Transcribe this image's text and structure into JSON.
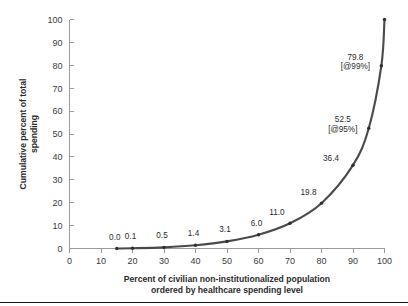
{
  "chart_data": {
    "type": "line",
    "title": "",
    "xlabel": "Percent of civilian non-institutionalized population ordered by healthcare spending level",
    "xlabel_line1": "Percent of civilian non-institutionalized population",
    "xlabel_line2": "ordered by healthcare spending level",
    "ylabel": "Cumulative percent of total spending",
    "ylabel_line1": "Cumulative percent of total",
    "ylabel_line2": "spending",
    "xlim": [
      0,
      100
    ],
    "ylim": [
      0,
      100
    ],
    "grid": false,
    "legend": "none",
    "xticks": [
      "0",
      "10",
      "20",
      "30",
      "40",
      "50",
      "60",
      "70",
      "80",
      "90",
      "100"
    ],
    "yticks": [
      "0",
      "10",
      "20",
      "30",
      "40",
      "50",
      "60",
      "70",
      "80",
      "90",
      "100"
    ],
    "x": [
      15,
      20,
      30,
      40,
      50,
      60,
      70,
      80,
      90,
      95,
      99,
      100
    ],
    "values": [
      0.0,
      0.1,
      0.5,
      1.4,
      3.1,
      6.0,
      11.0,
      19.8,
      36.4,
      52.5,
      79.8,
      100.0
    ],
    "series": [
      {
        "name": "Cumulative percent of total spending",
        "color": "#4a4a4a",
        "values": [
          0.0,
          0.1,
          0.5,
          1.4,
          3.1,
          6.0,
          11.0,
          19.8,
          36.4,
          52.5,
          79.8,
          100.0
        ]
      }
    ],
    "point_labels": [
      {
        "x": 15,
        "y": 0.0,
        "text": "0.0",
        "sub": ""
      },
      {
        "x": 20,
        "y": 0.1,
        "text": "0.1",
        "sub": ""
      },
      {
        "x": 30,
        "y": 0.5,
        "text": "0.5",
        "sub": ""
      },
      {
        "x": 40,
        "y": 1.4,
        "text": "1.4",
        "sub": ""
      },
      {
        "x": 50,
        "y": 3.1,
        "text": "3.1",
        "sub": ""
      },
      {
        "x": 60,
        "y": 6.0,
        "text": "6.0",
        "sub": ""
      },
      {
        "x": 70,
        "y": 11.0,
        "text": "11.0",
        "sub": ""
      },
      {
        "x": 80,
        "y": 19.8,
        "text": "19.8",
        "sub": ""
      },
      {
        "x": 90,
        "y": 36.4,
        "text": "36.4",
        "sub": ""
      },
      {
        "x": 95,
        "y": 52.5,
        "text": "52.5",
        "sub": "[@95%]"
      },
      {
        "x": 99,
        "y": 79.8,
        "text": "79.8",
        "sub": "[@99%]"
      }
    ],
    "colors": {
      "curve": "#4a4a4a",
      "marker": "#2f2f2f",
      "axis": "#9a9a9a",
      "text": "#2b2b2b",
      "background": "#ffffff"
    }
  }
}
